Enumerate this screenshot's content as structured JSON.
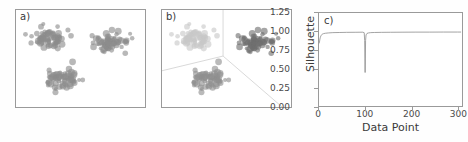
{
  "figure": {
    "background": "#ffffff",
    "panels": [
      "a)",
      "b)",
      "c)"
    ]
  },
  "panel_a": {
    "label": "a)",
    "caption": "unclustered scatter of three point groups, all same gray",
    "point_color": "#8c8c8c",
    "border_color": "#9a9a9a"
  },
  "panel_b": {
    "label": "b)",
    "caption": "same scatter colored by cluster with partition boundary lines",
    "cluster_colors": [
      "#c8c8c8",
      "#707070",
      "#909090"
    ],
    "boundary_color": "#d8d8d8",
    "border_color": "#9a9a9a"
  },
  "panel_c": {
    "label": "c)"
  },
  "chart_data": {
    "type": "line",
    "title": "",
    "xlabel": "Data Point",
    "ylabel": "Silhouette",
    "xlim": [
      0,
      310
    ],
    "ylim": [
      0.0,
      1.25
    ],
    "xticks": [
      0,
      100,
      200,
      300
    ],
    "xticklabels": [
      "0",
      "100",
      "200",
      "300"
    ],
    "yticks": [
      0.0,
      0.25,
      0.5,
      0.75,
      1.0,
      1.25
    ],
    "yticklabels": [
      "0.00",
      "0.25",
      "0.50",
      "0.75",
      "1.00",
      "1.25"
    ],
    "grid": false,
    "legend": null,
    "line_color": "#8a8a8a",
    "series": [
      {
        "name": "Silhouette",
        "x": [
          0,
          1,
          2,
          3,
          4,
          5,
          6,
          8,
          10,
          14,
          20,
          30,
          45,
          60,
          80,
          95,
          98,
          99,
          100,
          101,
          102,
          104,
          107,
          112,
          120,
          135,
          155,
          180,
          210,
          240,
          270,
          300,
          308
        ],
        "y": [
          0.84,
          0.86,
          0.9,
          0.925,
          0.94,
          0.952,
          0.96,
          0.968,
          0.973,
          0.978,
          0.982,
          0.986,
          0.988,
          0.99,
          0.991,
          0.992,
          0.985,
          0.88,
          0.45,
          0.88,
          0.955,
          0.975,
          0.982,
          0.986,
          0.988,
          0.99,
          0.991,
          0.992,
          0.993,
          0.993,
          0.994,
          0.994,
          0.994
        ]
      }
    ],
    "annotations": [
      {
        "text": "sharp dip",
        "x": 100,
        "y": 0.45
      }
    ]
  },
  "scatter_data": {
    "clusters": [
      {
        "name": "cluster-top-left",
        "center_pct": [
          26,
          30
        ],
        "spread_pct": [
          13,
          10
        ],
        "n": 70
      },
      {
        "name": "cluster-top-right",
        "center_pct": [
          74,
          33
        ],
        "spread_pct": [
          11,
          9
        ],
        "n": 65
      },
      {
        "name": "cluster-bottom",
        "center_pct": [
          36,
          71
        ],
        "spread_pct": [
          12,
          10
        ],
        "n": 68
      }
    ]
  }
}
